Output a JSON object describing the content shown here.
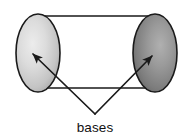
{
  "figure": {
    "name": "cylinder-bases-diagram",
    "type": "geometry-diagram",
    "background_color": "#ffffff",
    "stroke_color": "#1a1a1a",
    "label": {
      "text": "bases",
      "x": 95,
      "y": 130,
      "font_size": 13.5,
      "color": "#111111"
    },
    "shapes": {
      "cylinder_body": {
        "top_line": {
          "x1": 38,
          "y1": 16,
          "x2": 156,
          "y2": 16
        },
        "bottom_line": {
          "x1": 38,
          "y1": 88,
          "x2": 156,
          "y2": 88
        },
        "line_width": 1.6
      },
      "left_base": {
        "name": "left-base-ellipse",
        "cx": 38,
        "cy": 53,
        "rx": 22,
        "ry": 39,
        "fill_light": "#e6e6e6",
        "fill_mid": "#c9c9c9",
        "fill_dark": "#9d9d9d",
        "stroke": "#1a1a1a",
        "stroke_width": 1.6
      },
      "right_base": {
        "name": "right-base-ellipse",
        "cx": 155,
        "cy": 53,
        "rx": 22,
        "ry": 39,
        "fill_light": "#a8a8a8",
        "fill_mid": "#8a8a8a",
        "fill_dark": "#5f5f5f",
        "stroke": "#1a1a1a",
        "stroke_width": 1.6
      }
    },
    "leaders": {
      "vertex": {
        "x": 95,
        "y": 114
      },
      "left_arrow": {
        "name": "leader-arrow-left",
        "from": {
          "x": 95,
          "y": 114
        },
        "to": {
          "x": 33,
          "y": 54
        },
        "line_width": 1.7
      },
      "right_arrow": {
        "name": "leader-arrow-right",
        "from": {
          "x": 95,
          "y": 114
        },
        "to": {
          "x": 152,
          "y": 56
        },
        "line_width": 1.7
      },
      "arrowhead_color": "#1a1a1a"
    }
  }
}
